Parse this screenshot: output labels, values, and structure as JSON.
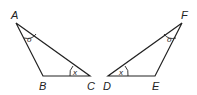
{
  "diagram": {
    "triangles": [
      {
        "name": "ABC",
        "vertices": {
          "A": "A",
          "B": "B",
          "C": "C"
        },
        "angle_marks": {
          "A": "o",
          "C": "x"
        }
      },
      {
        "name": "DEF",
        "vertices": {
          "D": "D",
          "E": "E",
          "F": "F"
        },
        "angle_marks": {
          "F": "o",
          "D": "x"
        }
      }
    ],
    "stroke_color": "#222222",
    "background": "#ffffff"
  }
}
